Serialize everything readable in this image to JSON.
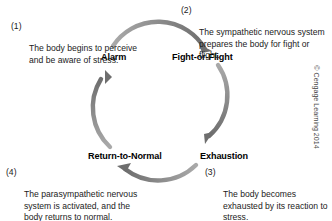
{
  "diagram": {
    "arc_color": "#7c7c7c",
    "text_color": "#1b1b1b",
    "stages": [
      {
        "id": "alarm",
        "label": "Alarm",
        "number": "(1)",
        "description": "The body begins to perceive and be aware of stress."
      },
      {
        "id": "fight-or-flight",
        "label": "Fight-or-Flight",
        "number": "(2)",
        "description": "The sympathetic nervous system prepares the body for fight or flight."
      },
      {
        "id": "exhaustion",
        "label": "Exhaustion",
        "number": "(3)",
        "description": "The body becomes exhausted by its reaction to stress."
      },
      {
        "id": "return-to-normal",
        "label": "Return-to-Normal",
        "number": "(4)",
        "description": "The parasympathetic nervous system is activated, and the body returns to normal."
      }
    ],
    "arrows": [
      {
        "id": "arc-alarm-to-fight",
        "from": "alarm",
        "to": "fight-or-flight"
      },
      {
        "id": "arc-fight-to-exhaustion",
        "from": "fight-or-flight",
        "to": "exhaustion"
      },
      {
        "id": "arc-exhaustion-to-return",
        "from": "exhaustion",
        "to": "return-to-normal"
      },
      {
        "id": "arc-return-to-alarm",
        "from": "return-to-normal",
        "to": "alarm"
      }
    ]
  },
  "copyright": "© Cengage Learning 2014"
}
